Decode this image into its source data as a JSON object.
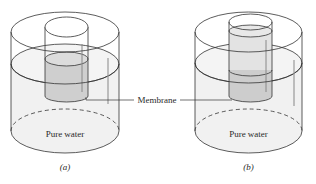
{
  "figure": {
    "panels": [
      {
        "id": "a",
        "caption": "(a)",
        "bottom_label": "Pure water",
        "outer": {
          "left": 11,
          "right": 119,
          "top_cy": 32,
          "water_cy": 64,
          "bottom_cy": 131,
          "ry": 20,
          "bottom_ry": 22
        },
        "inner": {
          "left": 45,
          "right": 88,
          "top_cy": 27,
          "ry": 10,
          "liquid_cy": 59,
          "bottom_cy": 96
        }
      },
      {
        "id": "b",
        "caption": "(b)",
        "bottom_label": "Pure water",
        "outer": {
          "left": 195,
          "right": 302,
          "top_cy": 32,
          "water_cy": 63,
          "bottom_cy": 131,
          "ry": 20,
          "bottom_ry": 22
        },
        "inner": {
          "left": 229,
          "right": 272,
          "top_cy": 22,
          "ry": 8,
          "liquid_cy": 31,
          "bottom_cy": 96
        }
      }
    ],
    "shared_label": "Membrane",
    "colors": {
      "line": "#333333",
      "water": "#f0f0f0",
      "solution": "#cfcfcf",
      "solution_light": "#e2e2e2"
    }
  }
}
